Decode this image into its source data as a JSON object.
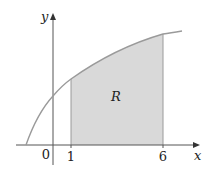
{
  "diagram": {
    "region_label": "R",
    "axis_x_label": "x",
    "axis_y_label": "y",
    "origin_label": "0",
    "tick_labels": [
      "1",
      "6"
    ],
    "colors": {
      "region_fill": "#d9d9d9",
      "curve": "#9a9a9a",
      "axis": "#555555"
    }
  }
}
